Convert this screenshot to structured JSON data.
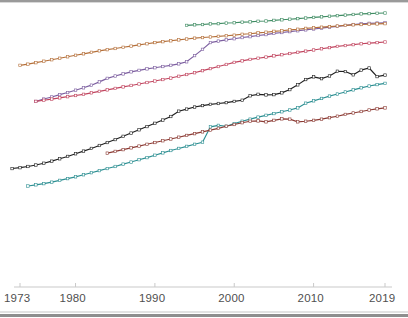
{
  "figure": {
    "background_color": "#ffffff",
    "border_color": "#9a9a9a"
  },
  "axis": {
    "color": "#c9c9c9",
    "label_color": "#4f4f4f",
    "tick_labels": [
      "1973",
      "1980",
      "1990",
      "2000",
      "2010",
      "2019"
    ],
    "tick_years": [
      1973,
      1980,
      1990,
      2000,
      2010,
      2019
    ]
  },
  "chart_data": {
    "type": "line",
    "title": "",
    "subtitle": "",
    "xlabel": "",
    "ylabel": "",
    "xlim": [
      1972,
      2019
    ],
    "ylim": [
      0,
      100
    ],
    "grid": false,
    "legend": "none",
    "markers": "square",
    "xticks": [
      1973,
      1980,
      1990,
      2000,
      2010,
      2019
    ],
    "xticklabels": [
      "1973",
      "1980",
      "1990",
      "2000",
      "2010",
      "2019"
    ],
    "series": [
      {
        "name": "series-green",
        "color": "#3f8c63",
        "x": [
          1994,
          1995,
          1996,
          1997,
          1998,
          1999,
          2000,
          2001,
          2002,
          2003,
          2004,
          2005,
          2006,
          2007,
          2008,
          2009,
          2010,
          2011,
          2012,
          2013,
          2014,
          2015,
          2016,
          2017,
          2018,
          2019
        ],
        "y": [
          91.7,
          91.9,
          92.0,
          92.2,
          92.3,
          92.5,
          92.6,
          92.8,
          92.9,
          93.1,
          93.2,
          93.4,
          93.6,
          93.8,
          94.0,
          94.2,
          94.4,
          94.6,
          94.8,
          95.0,
          95.2,
          95.4,
          95.6,
          95.7,
          95.8,
          95.9
        ]
      },
      {
        "name": "series-purple",
        "color": "#7d5fa0",
        "x": [
          1975,
          1976,
          1977,
          1978,
          1979,
          1980,
          1981,
          1982,
          1983,
          1984,
          1985,
          1986,
          1987,
          1988,
          1989,
          1990,
          1991,
          1992,
          1993,
          1994,
          1995,
          1996,
          1997,
          1998,
          1999,
          2000,
          2001,
          2002,
          2003,
          2004,
          2005,
          2006,
          2007,
          2008,
          2009,
          2010,
          2011,
          2012,
          2013,
          2014,
          2015,
          2016,
          2017,
          2018,
          2019
        ],
        "y": [
          66.0,
          66.8,
          67.5,
          68.3,
          69.0,
          69.8,
          70.6,
          71.5,
          72.6,
          73.8,
          74.6,
          75.3,
          76.0,
          76.5,
          77.0,
          77.4,
          77.8,
          78.2,
          78.7,
          79.4,
          81.5,
          83.6,
          85.9,
          86.4,
          86.8,
          87.2,
          87.6,
          87.9,
          88.3,
          88.6,
          89.0,
          89.3,
          89.6,
          89.9,
          90.2,
          90.5,
          90.8,
          91.1,
          91.4,
          91.7,
          92.0,
          92.2,
          92.4,
          92.5,
          92.6
        ]
      },
      {
        "name": "series-orange",
        "color": "#b5703a",
        "x": [
          1973,
          1974,
          1975,
          1976,
          1977,
          1978,
          1979,
          1980,
          1981,
          1982,
          1983,
          1984,
          1985,
          1986,
          1987,
          1988,
          1989,
          1990,
          1991,
          1992,
          1993,
          1994,
          1995,
          1996,
          1997,
          1998,
          1999,
          2000,
          2001,
          2002,
          2003,
          2004,
          2005,
          2006,
          2007,
          2008,
          2009,
          2010,
          2011,
          2012,
          2013,
          2014,
          2015,
          2016,
          2017,
          2018,
          2019
        ],
        "y": [
          78.2,
          78.6,
          79.1,
          79.6,
          80.1,
          80.6,
          81.1,
          81.6,
          82.1,
          82.6,
          83.1,
          83.5,
          83.9,
          84.3,
          84.7,
          85.1,
          85.5,
          85.9,
          86.2,
          86.5,
          86.8,
          87.1,
          87.4,
          87.6,
          87.8,
          88.0,
          88.2,
          88.4,
          88.7,
          88.9,
          89.2,
          89.4,
          89.7,
          89.9,
          90.2,
          90.4,
          90.7,
          90.9,
          91.1,
          91.3,
          91.5,
          91.7,
          91.9,
          92.0,
          92.1,
          92.2,
          92.3
        ]
      },
      {
        "name": "series-magenta",
        "color": "#c1455f",
        "x": [
          1975,
          1976,
          1977,
          1978,
          1979,
          1980,
          1981,
          1982,
          1983,
          1984,
          1985,
          1986,
          1987,
          1988,
          1989,
          1990,
          1991,
          1992,
          1993,
          1994,
          1995,
          1996,
          1997,
          1998,
          1999,
          2000,
          2001,
          2002,
          2003,
          2004,
          2005,
          2006,
          2007,
          2008,
          2009,
          2010,
          2011,
          2012,
          2013,
          2014,
          2015,
          2016,
          2017,
          2018,
          2019
        ],
        "y": [
          66.0,
          66.4,
          66.8,
          67.2,
          67.6,
          68.0,
          68.4,
          68.9,
          69.4,
          69.9,
          70.4,
          70.9,
          71.4,
          71.9,
          72.4,
          72.9,
          73.4,
          73.9,
          74.5,
          75.1,
          75.7,
          76.4,
          77.1,
          77.8,
          78.5,
          79.2,
          79.7,
          80.2,
          80.6,
          81.0,
          81.4,
          81.8,
          82.2,
          82.6,
          83.0,
          83.4,
          83.8,
          84.2,
          84.6,
          84.9,
          85.2,
          85.5,
          85.7,
          85.9,
          86.1
        ]
      },
      {
        "name": "series-black",
        "color": "#1f1f1f",
        "x": [
          1972,
          1973,
          1974,
          1975,
          1976,
          1977,
          1978,
          1979,
          1980,
          1981,
          1982,
          1983,
          1984,
          1985,
          1986,
          1987,
          1988,
          1989,
          1990,
          1991,
          1992,
          1993,
          1994,
          1995,
          1996,
          1997,
          1998,
          1999,
          2000,
          2001,
          2002,
          2003,
          2004,
          2005,
          2006,
          2007,
          2008,
          2009,
          2010,
          2011,
          2012,
          2013,
          2014,
          2015,
          2016,
          2017,
          2018,
          2019
        ],
        "y": [
          43.3,
          43.6,
          44.0,
          44.5,
          45.1,
          45.8,
          46.6,
          47.4,
          48.3,
          49.2,
          50.1,
          51.1,
          52.1,
          53.1,
          54.2,
          55.3,
          56.4,
          57.5,
          58.6,
          59.7,
          60.9,
          62.7,
          63.4,
          64.1,
          64.6,
          65.0,
          65.3,
          65.6,
          66.0,
          66.4,
          67.9,
          68.4,
          68.2,
          68.3,
          68.9,
          70.0,
          71.6,
          73.4,
          74.3,
          73.7,
          74.6,
          76.2,
          76.1,
          75.0,
          76.6,
          77.3,
          74.4,
          74.9
        ]
      },
      {
        "name": "series-teal",
        "color": "#2c8f92",
        "x": [
          1974,
          1975,
          1976,
          1977,
          1978,
          1979,
          1980,
          1981,
          1982,
          1983,
          1984,
          1985,
          1986,
          1987,
          1988,
          1989,
          1990,
          1991,
          1992,
          1993,
          1994,
          1995,
          1996,
          1997,
          1998,
          1999,
          2000,
          2001,
          2002,
          2003,
          2004,
          2005,
          2006,
          2007,
          2008,
          2009,
          2010,
          2011,
          2012,
          2013,
          2014,
          2015,
          2016,
          2017,
          2018,
          2019
        ],
        "y": [
          37.4,
          37.8,
          38.2,
          38.7,
          39.3,
          39.9,
          40.5,
          41.2,
          41.9,
          42.6,
          43.3,
          44.0,
          44.8,
          45.5,
          46.3,
          47.0,
          47.8,
          48.6,
          49.4,
          50.1,
          50.8,
          51.5,
          52.2,
          57.4,
          57.9,
          57.6,
          58.5,
          59.3,
          60.0,
          60.7,
          61.3,
          61.9,
          62.5,
          63.1,
          63.8,
          65.4,
          66.2,
          67.0,
          67.8,
          68.5,
          69.2,
          69.9,
          70.6,
          71.2,
          71.7,
          72.1
        ]
      },
      {
        "name": "series-darkred",
        "color": "#8c3b34",
        "x": [
          1984,
          1985,
          1986,
          1987,
          1988,
          1989,
          1990,
          1991,
          1992,
          1993,
          1994,
          1995,
          1996,
          1997,
          1998,
          1999,
          2000,
          2001,
          2002,
          2003,
          2004,
          2005,
          2006,
          2007,
          2008,
          2009,
          2010,
          2011,
          2012,
          2013,
          2014,
          2015,
          2016,
          2017,
          2018,
          2019
        ],
        "y": [
          48.5,
          49.1,
          49.7,
          50.3,
          50.9,
          51.5,
          52.1,
          52.7,
          53.3,
          53.9,
          54.5,
          55.1,
          55.7,
          56.3,
          56.9,
          57.6,
          58.2,
          58.8,
          59.3,
          59.4,
          59.1,
          59.6,
          60.1,
          60.0,
          59.1,
          59.3,
          59.6,
          60.0,
          60.5,
          61.0,
          61.6,
          62.1,
          62.6,
          63.1,
          63.5,
          63.8
        ]
      }
    ]
  }
}
